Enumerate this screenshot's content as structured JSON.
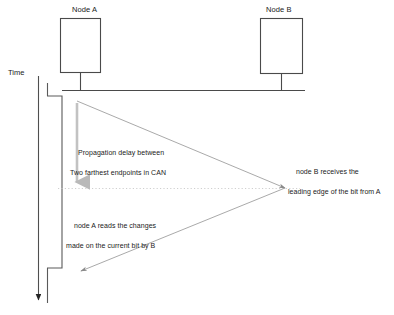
{
  "diagram": {
    "title_present": false,
    "axis": {
      "label": "Time",
      "direction": "downward",
      "arrow_icon": "arrow-down-icon"
    },
    "nodes": [
      {
        "id": "node-a",
        "label": "Node A",
        "box": {
          "x": 60,
          "y": 18,
          "w": 40,
          "h": 54
        },
        "stem_x": 80
      },
      {
        "id": "node-b",
        "label": "Node B",
        "box": {
          "x": 260,
          "y": 18,
          "w": 42,
          "h": 55
        },
        "stem_x": 281
      }
    ],
    "bus": {
      "y": 90,
      "x1": 62,
      "x2": 305,
      "name": "can-bus-line"
    },
    "annotations": [
      {
        "id": "propagation-delay",
        "line1": "Propagation delay between",
        "line2": "Two farthest endpoints in CAN",
        "x": 70,
        "y": 140
      },
      {
        "id": "node-b-receives",
        "line1": "node B receives the",
        "line2": "leading edge of the bit from A",
        "x": 288,
        "y": 158
      },
      {
        "id": "node-a-reads",
        "line1": "node A reads the changes",
        "line2": "made on the current bit by B",
        "x": 66,
        "y": 212
      }
    ],
    "signals": {
      "delay_arrow": {
        "x": 77,
        "y1": 103,
        "y2": 186,
        "color": "#b3b3b3"
      },
      "dotted_line": {
        "y": 188,
        "x1": 58,
        "x2": 300,
        "color": "#c8c8c8"
      },
      "bit_edge_to_b": {
        "x1": 77,
        "y1": 101,
        "x2": 285,
        "y2": 188
      },
      "bit_edge_to_a": {
        "x1": 285,
        "y1": 188,
        "x2": 80,
        "y2": 271
      },
      "waveform": {
        "x_low": 47,
        "x_high": 62,
        "y_top": 83,
        "y_step_down": 96,
        "y_step_up": 268,
        "y_bottom": 303
      }
    },
    "colors": {
      "stroke_dark": "#3d3d3d",
      "stroke_mid": "#6e6e6e",
      "stroke_light": "#b3b3b3",
      "stroke_faint": "#cfcfcf",
      "text": "#1a1a1a",
      "background": "#ffffff"
    }
  }
}
